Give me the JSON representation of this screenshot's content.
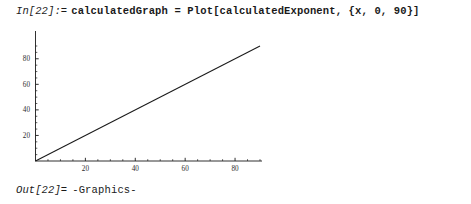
{
  "notebook": {
    "background_color": "#ffffff",
    "foreground_color": "#1a1a1a"
  },
  "input_cell": {
    "label": "In[22]:=",
    "code": "calculatedGraph = Plot[calculatedExponent, {x, 0, 90}]"
  },
  "output_cell": {
    "label": "Out[22]=",
    "value": "-Graphics-"
  },
  "chart_data": {
    "type": "line",
    "title": "",
    "xlabel": "",
    "ylabel": "",
    "xlim": [
      0,
      90
    ],
    "ylim": [
      0,
      90
    ],
    "grid": false,
    "legend": "none",
    "axis_color": "#1a1a1a",
    "line_color": "#1a1a1a",
    "xticks": [
      20,
      40,
      60,
      80
    ],
    "xtick_labels": [
      "20",
      "40",
      "60",
      "80"
    ],
    "yticks": [
      20,
      40,
      60,
      80
    ],
    "ytick_labels": [
      "20",
      "40",
      "60",
      "80"
    ],
    "series": [
      {
        "name": "calculatedExponent",
        "x": [
          0,
          90
        ],
        "y": [
          0,
          90
        ]
      }
    ]
  }
}
